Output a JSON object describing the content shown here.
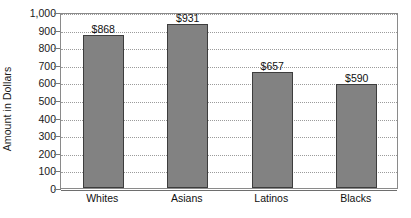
{
  "chart_data": {
    "type": "bar",
    "title": "",
    "xlabel": "",
    "ylabel": "Amount in Dollars",
    "categories": [
      "Whites",
      "Asians",
      "Latinos",
      "Blacks"
    ],
    "values": [
      868,
      931,
      657,
      590
    ],
    "value_labels": [
      "$868",
      "$931",
      "$657",
      "$590"
    ],
    "ylim": [
      0,
      1000
    ],
    "ytick_values": [
      0,
      100,
      200,
      300,
      400,
      500,
      600,
      700,
      800,
      900,
      1000
    ],
    "ytick_labels": [
      "0",
      "100",
      "200",
      "300",
      "400",
      "500",
      "600",
      "700",
      "800",
      "900",
      "1,000"
    ],
    "grid": true,
    "legend": "none",
    "colors": {
      "bar_fill": "#828282",
      "bar_border": "#3d3d3d",
      "gridline": "#9b9b9b",
      "axis": "#8a8a8a",
      "text": "#111111",
      "background": "#ffffff"
    }
  }
}
